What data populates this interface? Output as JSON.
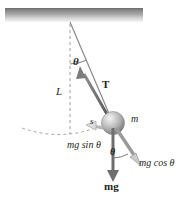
{
  "figure": {
    "type": "physics-free-body-diagram",
    "width": 186,
    "height": 205,
    "background_color": "#ffffff"
  },
  "colors": {
    "ink": "#231f20",
    "ceiling_top": "#6f6f6f",
    "ceiling_bottom": "#f2f2f2",
    "ball_light": "#f0f0f0",
    "ball_mid": "#bdbdbd",
    "ball_dark": "#7d7d7d",
    "dashed_line": "#9a9a9a",
    "vector": "#595959"
  },
  "labels": {
    "theta_top": "θ",
    "length": "L",
    "tension": "T",
    "mass": "m",
    "arc_length": "s",
    "tangential_force": "mg sin θ",
    "theta_bottom": "θ",
    "radial_force": "mg cos θ",
    "weight": "mg"
  },
  "elements": {
    "ceiling": {
      "name": "ceiling-support",
      "x": 5,
      "y": 8,
      "width": 138,
      "height": 14
    },
    "pivot": {
      "x": 70,
      "y": 22
    },
    "bob": {
      "cx": 113,
      "cy": 123,
      "r": 11
    },
    "string": {
      "from": [
        70,
        22
      ],
      "to": [
        113,
        123
      ]
    },
    "vertical_dashed": {
      "from": [
        70,
        24
      ],
      "to": [
        70,
        133
      ]
    },
    "swing_arc_dashed": {
      "description": "dashed circular arc showing pendulum path"
    },
    "angle_arc_top": {
      "description": "arc between vertical dashed line and string at pivot"
    },
    "angle_arc_bottom": {
      "description": "arc between weight vector and radial component at bob"
    }
  },
  "vectors": [
    {
      "name": "tension-vector",
      "label": "T",
      "from": [
        108,
        116
      ],
      "to": [
        80,
        70
      ],
      "style": "bold-arrow-up-left"
    },
    {
      "name": "weight-vector",
      "label": "mg",
      "from": [
        113,
        126
      ],
      "to": [
        113,
        180
      ],
      "style": "bold-arrow-down"
    },
    {
      "name": "radial-vector",
      "label": "mg cos θ",
      "from": [
        115,
        127
      ],
      "to": [
        142,
        165
      ],
      "style": "outline-arrow-down-right"
    },
    {
      "name": "tangential-vector",
      "label": "mg sin θ",
      "from": [
        103,
        127
      ],
      "to": [
        86,
        124
      ],
      "style": "outline-arrow-left"
    }
  ]
}
